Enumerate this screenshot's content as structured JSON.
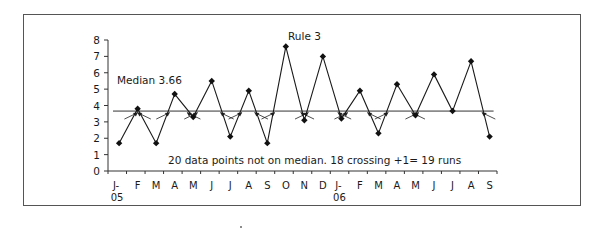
{
  "chart_data": {
    "type": "line",
    "title": "",
    "xlabel": "",
    "ylabel": "",
    "ylim": [
      0,
      8
    ],
    "yticks": [
      0,
      1,
      2,
      3,
      4,
      5,
      6,
      7,
      8
    ],
    "grid": false,
    "legend": null,
    "categories": [
      "J-\n05",
      "F",
      "M",
      "A",
      "M",
      "J",
      "J",
      "A",
      "S",
      "O",
      "N",
      "D",
      "J-\n06",
      "F",
      "M",
      "A",
      "M",
      "J",
      "J",
      "A",
      "S"
    ],
    "category_labels": [
      {
        "main": "J-",
        "sub": "05"
      },
      {
        "main": "F"
      },
      {
        "main": "M"
      },
      {
        "main": "A"
      },
      {
        "main": "M"
      },
      {
        "main": "J"
      },
      {
        "main": "J"
      },
      {
        "main": "A"
      },
      {
        "main": "S"
      },
      {
        "main": "O"
      },
      {
        "main": "N"
      },
      {
        "main": "D"
      },
      {
        "main": "J-",
        "sub": "06"
      },
      {
        "main": "F"
      },
      {
        "main": "M"
      },
      {
        "main": "A"
      },
      {
        "main": "M"
      },
      {
        "main": "J"
      },
      {
        "main": "J"
      },
      {
        "main": "A"
      },
      {
        "main": "S"
      }
    ],
    "series": [
      {
        "name": "Data",
        "marker": "diamond",
        "values": [
          1.7,
          3.8,
          1.7,
          4.7,
          3.3,
          5.5,
          2.1,
          4.9,
          1.7,
          7.6,
          3.1,
          7.0,
          3.2,
          4.9,
          2.3,
          5.3,
          3.4,
          5.9,
          3.66,
          6.7,
          2.1
        ]
      },
      {
        "name": "Median",
        "type": "hline",
        "value": 3.66
      }
    ],
    "annotations": [
      {
        "text": "Median 3.66",
        "near": "median line, upper left"
      },
      {
        "text": "Rule 3",
        "near": "top center"
      },
      {
        "text": "20 data points not on median. 18 crossing +1= 19 runs",
        "near": "bottom center"
      }
    ],
    "crossing_arrows": 18
  },
  "labels": {
    "median": "Median 3.66",
    "rule": "Rule 3",
    "summary": "20 data points not on median. 18 crossing +1= 19 runs"
  },
  "colors": {
    "line": "#1a1a1a",
    "axis": "#333333",
    "frame": "#555555"
  }
}
